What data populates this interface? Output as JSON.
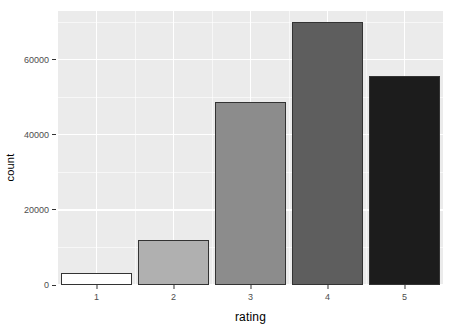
{
  "chart_data": {
    "type": "bar",
    "title": "",
    "subtitle": "",
    "xlabel": "rating",
    "ylabel": "count",
    "categories": [
      "1",
      "2",
      "3",
      "4",
      "5"
    ],
    "values": [
      3200,
      12000,
      48800,
      70000,
      55700
    ],
    "bar_fills": [
      "#ffffff",
      "#b0b0b0",
      "#8c8c8c",
      "#5e5e5e",
      "#1c1c1c"
    ],
    "bar_outline": "#333333",
    "xlim": [
      0.5,
      5.5
    ],
    "ylim": [
      0,
      73000
    ],
    "ytick_values": [
      0,
      20000,
      40000,
      60000
    ],
    "ytick_labels": [
      "0",
      "20000",
      "40000",
      "60000"
    ],
    "yminor_values": [
      10000,
      30000,
      50000,
      70000
    ],
    "xtick_values": [
      1,
      2,
      3,
      4,
      5
    ],
    "xtick_labels": [
      "1",
      "2",
      "3",
      "4",
      "5"
    ],
    "xminor_values": [
      1.5,
      2.5,
      3.5,
      4.5
    ],
    "grid": true,
    "panel_background": "#ebebeb",
    "grid_color": "#ffffff",
    "legend": null,
    "legend_position": "none"
  }
}
